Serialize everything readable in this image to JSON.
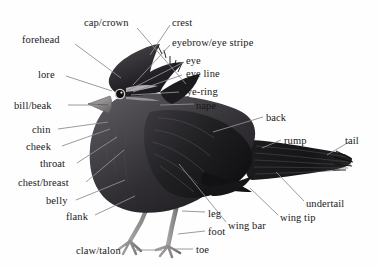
{
  "figure": {
    "background_color": "#fefefe",
    "label_color": "#19181a",
    "leader_line_color": "#8f9094",
    "bird_colors": {
      "body_dark": "#1d1c1e",
      "body_mid": "#3a383b",
      "body_light": "#6c696d",
      "highlight": "#b9b6b8",
      "beak": "#9a9597",
      "leg": "#8d8a8c",
      "eye": "#0d0d0e"
    }
  },
  "labels": [
    {
      "id": "cap-crown",
      "text": "cap/crown",
      "x": 84,
      "y": 17,
      "align": "left",
      "line": [
        137,
        28,
        186,
        84
      ]
    },
    {
      "id": "crest",
      "text": "crest",
      "x": 172,
      "y": 17,
      "align": "left",
      "line": [
        170,
        25,
        150,
        55
      ]
    },
    {
      "id": "forehead",
      "text": "forehead",
      "x": 22,
      "y": 34,
      "align": "left",
      "line": [
        75,
        44,
        121,
        78
      ]
    },
    {
      "id": "eyebrow",
      "text": "eyebrow/eye stripe",
      "x": 172,
      "y": 37,
      "align": "left",
      "line": [
        170,
        45,
        133,
        85
      ]
    },
    {
      "id": "eye",
      "text": "eye",
      "x": 186,
      "y": 55,
      "align": "left",
      "line": [
        184,
        62,
        127,
        91
      ]
    },
    {
      "id": "lore",
      "text": "lore",
      "x": 38,
      "y": 69,
      "align": "left",
      "line": [
        66,
        76,
        112,
        91
      ]
    },
    {
      "id": "eye-line",
      "text": "eye line",
      "x": 186,
      "y": 68,
      "align": "left",
      "line": [
        182,
        75,
        133,
        92
      ]
    },
    {
      "id": "eye-ring",
      "text": "eye-ring",
      "x": 182,
      "y": 86,
      "align": "left",
      "line": [
        179,
        92,
        131,
        95
      ]
    },
    {
      "id": "bill-beak",
      "text": "bill/beak",
      "x": 14,
      "y": 100,
      "align": "left",
      "line": [
        68,
        105,
        98,
        105
      ]
    },
    {
      "id": "nape",
      "text": "nape",
      "x": 196,
      "y": 100,
      "align": "left",
      "line": [
        194,
        104,
        160,
        105
      ]
    },
    {
      "id": "back",
      "text": "back",
      "x": 266,
      "y": 112,
      "align": "left",
      "line": [
        263,
        117,
        213,
        132
      ]
    },
    {
      "id": "chin",
      "text": "chin",
      "x": 32,
      "y": 124,
      "align": "left",
      "line": [
        58,
        129,
        108,
        122
      ]
    },
    {
      "id": "rump",
      "text": "rump",
      "x": 284,
      "y": 135,
      "align": "left",
      "line": [
        281,
        140,
        262,
        148
      ]
    },
    {
      "id": "tail",
      "text": "tail",
      "x": 345,
      "y": 135,
      "align": "left",
      "line": [
        349,
        142,
        327,
        155
      ]
    },
    {
      "id": "cheek",
      "text": "cheek",
      "x": 26,
      "y": 141,
      "align": "left",
      "line": [
        62,
        146,
        110,
        129
      ]
    },
    {
      "id": "throat",
      "text": "throat",
      "x": 40,
      "y": 158,
      "align": "left",
      "line": [
        77,
        163,
        117,
        137
      ]
    },
    {
      "id": "chest-breast",
      "text": "chest/breast",
      "x": 18,
      "y": 177,
      "align": "left",
      "line": [
        86,
        182,
        124,
        150
      ]
    },
    {
      "id": "belly",
      "text": "belly",
      "x": 46,
      "y": 195,
      "align": "left",
      "line": [
        76,
        200,
        125,
        180
      ]
    },
    {
      "id": "undertail",
      "text": "undertail",
      "x": 306,
      "y": 198,
      "align": "left",
      "line": [
        304,
        201,
        276,
        172
      ]
    },
    {
      "id": "flank",
      "text": "flank",
      "x": 66,
      "y": 211,
      "align": "left",
      "line": [
        95,
        215,
        135,
        196
      ]
    },
    {
      "id": "leg",
      "text": "leg",
      "x": 208,
      "y": 208,
      "align": "left",
      "line": [
        205,
        212,
        182,
        211
      ]
    },
    {
      "id": "wing-tip",
      "text": "wing tip",
      "x": 280,
      "y": 212,
      "align": "left",
      "line": [
        278,
        215,
        250,
        188
      ]
    },
    {
      "id": "wing-bar",
      "text": "wing bar",
      "x": 228,
      "y": 220,
      "align": "left",
      "line": [
        226,
        222,
        179,
        164
      ]
    },
    {
      "id": "foot",
      "text": "foot",
      "x": 208,
      "y": 226,
      "align": "left",
      "line": [
        205,
        231,
        178,
        234
      ]
    },
    {
      "id": "claw-talon",
      "text": "claw/talon",
      "x": 76,
      "y": 245,
      "align": "left",
      "line": [
        133,
        250,
        162,
        250
      ]
    },
    {
      "id": "toe",
      "text": "toe",
      "x": 196,
      "y": 244,
      "align": "left",
      "line": [
        193,
        249,
        172,
        249
      ]
    }
  ]
}
